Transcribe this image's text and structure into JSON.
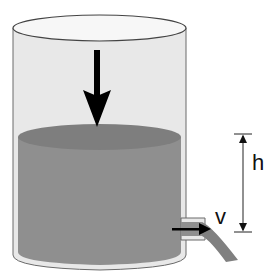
{
  "diagram": {
    "labels": {
      "height": "h",
      "velocity": "v"
    },
    "colors": {
      "tank_glass": "#e6e6e6",
      "tank_outline": "#555555",
      "water": "#8e8e8e",
      "water_surface": "#7f7f7f",
      "arrow": "#000000",
      "background": "#ffffff"
    },
    "elements": [
      "cylindrical-tank",
      "water-body",
      "downward-arrow",
      "outlet-spout",
      "water-jet",
      "velocity-arrow",
      "height-dimension"
    ]
  }
}
